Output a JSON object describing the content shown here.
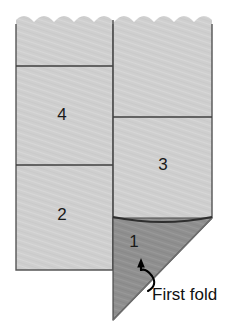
{
  "diagram": {
    "caption": {
      "text": "First fold",
      "x": 152,
      "y": 296
    },
    "colors": {
      "paper_light": "#cfcfcf",
      "paper_light_alt": "#d6d6d6",
      "paper_dark": "#8f8f8f",
      "paper_dark_alt": "#969696",
      "outline": "#444444",
      "fold_line": "#3a3a3a",
      "label": "#1a1a1a",
      "arrow": "#000000",
      "background": "#ffffff"
    },
    "panels": [
      {
        "id": "panel-1",
        "label": "1",
        "shade": "dark",
        "label_x": 134,
        "label_y": 243,
        "description": "folded triangular flap"
      },
      {
        "id": "panel-2",
        "label": "2",
        "shade": "light",
        "label_x": 62,
        "label_y": 216,
        "description": "lower left panel"
      },
      {
        "id": "panel-3",
        "label": "3",
        "shade": "light",
        "label_x": 163,
        "label_y": 166,
        "description": "lower right panel"
      },
      {
        "id": "panel-4",
        "label": "4",
        "shade": "light",
        "label_x": 62,
        "label_y": 116,
        "description": "middle left panel"
      }
    ],
    "geometry": {
      "left_column": {
        "x_left": 16,
        "x_right": 113,
        "y_top": 22,
        "y_bottom": 270
      },
      "right_column": {
        "x_left": 113,
        "x_right": 212,
        "y_top": 22,
        "y_bottom": 218
      },
      "divider_left_upper_y": 66,
      "divider_left_lower_y": 165,
      "divider_right_y": 117,
      "triangle": {
        "apex_x": 113,
        "apex_y": 320,
        "top_left_x": 113,
        "top_right_x": 212,
        "top_y": 218
      },
      "torn_edge_y": 22,
      "scallop_count": 10
    },
    "arrow": {
      "name": "curved-fold-arrow",
      "tip_x": 142,
      "tip_y": 263,
      "description": "curved hook arrow pointing up at fold"
    }
  }
}
